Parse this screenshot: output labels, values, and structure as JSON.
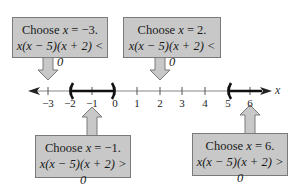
{
  "number_line": {
    "axis_label": "x",
    "ticks": [
      {
        "value": -3,
        "label": "−3",
        "x": 48
      },
      {
        "value": -2,
        "label": "−2",
        "x": 70
      },
      {
        "value": -1,
        "label": "−1",
        "x": 92
      },
      {
        "value": 0,
        "label": "0",
        "x": 115
      },
      {
        "value": 1,
        "label": "1",
        "x": 137
      },
      {
        "value": 2,
        "label": "2",
        "x": 160
      },
      {
        "value": 3,
        "label": "3",
        "x": 182
      },
      {
        "value": 4,
        "label": "4",
        "x": 205
      },
      {
        "value": 5,
        "label": "5",
        "x": 228
      },
      {
        "value": 6,
        "label": "6",
        "x": 250
      }
    ],
    "solution_intervals": [
      "(−2, 0)",
      "(5, ∞)"
    ]
  },
  "callouts": [
    {
      "id": "test-neg3",
      "line1_prefix": "Choose ",
      "var": "x",
      "line1_suffix": " = −3.",
      "line2": "x(x − 5)(x + 2) < 0"
    },
    {
      "id": "test-2",
      "line1_prefix": "Choose ",
      "var": "x",
      "line1_suffix": " = 2.",
      "line2": "x(x − 5)(x + 2) < 0"
    },
    {
      "id": "test-neg1",
      "line1_prefix": "Choose ",
      "var": "x",
      "line1_suffix": " = −1.",
      "line2": "x(x − 5)(x + 2) > 0"
    },
    {
      "id": "test-6",
      "line1_prefix": "Choose ",
      "var": "x",
      "line1_suffix": " = 6.",
      "line2": "x(x − 5)(x + 2) > 0"
    }
  ]
}
